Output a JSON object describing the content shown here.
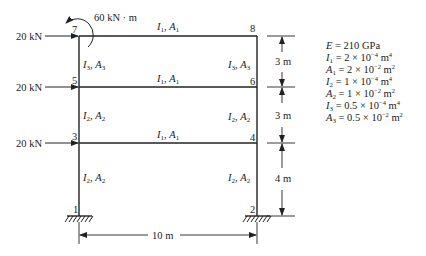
{
  "figure": {
    "loads": {
      "moment": "60 kN · m",
      "force_top": "20 kN",
      "force_mid": "20 kN",
      "force_low": "20 kN"
    },
    "nodes": [
      "1",
      "2",
      "3",
      "4",
      "5",
      "6",
      "7",
      "8"
    ],
    "members": {
      "beam_top": {
        "I": "I",
        "Isub": "1",
        "A": "A",
        "Asub": "1"
      },
      "beam_mid": {
        "I": "I",
        "Isub": "1",
        "A": "A",
        "Asub": "1"
      },
      "beam_low": {
        "I": "I",
        "Isub": "1",
        "A": "A",
        "Asub": "1"
      },
      "col_left_top": {
        "I": "I",
        "Isub": "3",
        "A": "A",
        "Asub": "3"
      },
      "col_right_top": {
        "I": "I",
        "Isub": "3",
        "A": "A",
        "Asub": "3"
      },
      "col_left_mid": {
        "I": "I",
        "Isub": "2",
        "A": "A",
        "Asub": "2"
      },
      "col_right_mid": {
        "I": "I",
        "Isub": "2",
        "A": "A",
        "Asub": "2"
      },
      "col_left_low": {
        "I": "I",
        "Isub": "2",
        "A": "A",
        "Asub": "2"
      },
      "col_right_low": {
        "I": "I",
        "Isub": "2",
        "A": "A",
        "Asub": "2"
      }
    },
    "dimensions": {
      "story_top": "3 m",
      "story_mid": "3 m",
      "story_low": "4 m",
      "span": "10 m"
    },
    "properties": [
      {
        "sym": "E",
        "sub": "",
        "val": "210 GPa",
        "exp": "",
        "unit": "",
        "unitexp": ""
      },
      {
        "sym": "I",
        "sub": "1",
        "val": "2 × 10",
        "exp": "−4",
        "unit": " m",
        "unitexp": "4"
      },
      {
        "sym": "A",
        "sub": "1",
        "val": "2 × 10",
        "exp": "−2",
        "unit": " m",
        "unitexp": "2"
      },
      {
        "sym": "I",
        "sub": "2",
        "val": "1 × 10",
        "exp": "−4",
        "unit": " m",
        "unitexp": "4"
      },
      {
        "sym": "A",
        "sub": "2",
        "val": "1 × 10",
        "exp": "−2",
        "unit": " m",
        "unitexp": "2"
      },
      {
        "sym": "I",
        "sub": "3",
        "val": "0.5 × 10",
        "exp": "−4",
        "unit": " m",
        "unitexp": "4"
      },
      {
        "sym": "A",
        "sub": "3",
        "val": "0.5 × 10",
        "exp": "−2",
        "unit": " m",
        "unitexp": "2"
      }
    ],
    "colors": {
      "ink": "#222222",
      "background": "#ffffff"
    }
  }
}
